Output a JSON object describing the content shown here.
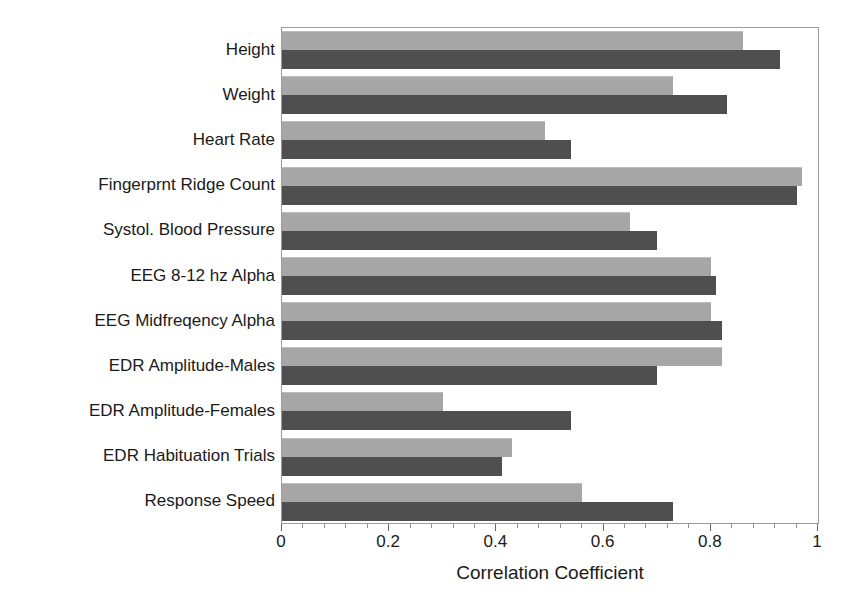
{
  "chart_data": {
    "type": "bar",
    "orientation": "horizontal",
    "title": "",
    "xlabel": "Correlation Coefficient",
    "ylabel": "",
    "xlim": [
      0,
      1
    ],
    "xticks": [
      "0",
      "0.2",
      "0.4",
      "0.6",
      "0.8",
      "1"
    ],
    "xtick_values": [
      0,
      0.2,
      0.4,
      0.6,
      0.8,
      1
    ],
    "minor_ticks": true,
    "grid": false,
    "legend": "none",
    "categories": [
      "Height",
      "Weight",
      "Heart Rate",
      "Fingerprnt Ridge Count",
      "Systol. Blood Pressure",
      "EEG 8-12 hz Alpha",
      "EEG Midfreqency Alpha",
      "EDR Amplitude-Males",
      "EDR Amplitude-Females",
      "EDR Habituation Trials",
      "Response Speed"
    ],
    "series": [
      {
        "name": "light-series",
        "color": "#a6a6a6",
        "values": [
          0.86,
          0.73,
          0.49,
          0.97,
          0.65,
          0.8,
          0.8,
          0.82,
          0.3,
          0.43,
          0.56
        ]
      },
      {
        "name": "dark-series",
        "color": "#4f4f4f",
        "values": [
          0.93,
          0.83,
          0.54,
          0.96,
          0.7,
          0.81,
          0.82,
          0.7,
          0.54,
          0.41,
          0.73
        ]
      }
    ]
  },
  "colors": {
    "light_bar": "#a6a6a6",
    "dark_bar": "#4f4f4f",
    "frame": "#9a9a9a",
    "text": "#1a1a1a",
    "background": "#ffffff"
  }
}
